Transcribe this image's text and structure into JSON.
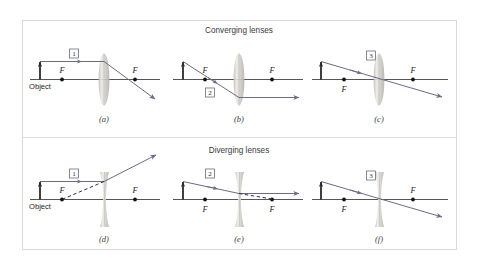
{
  "figure": {
    "background": "#ffffff",
    "frame_color": "#d8d8d8",
    "axis_color": "#555555",
    "ray_color": "#6b6b86",
    "lens_color": "#c9c7c2",
    "sections": [
      {
        "id": "converging",
        "title": "Converging lenses",
        "lens_type": "biconvex",
        "panels": [
          {
            "key": "a",
            "caption": "(a)",
            "ray_number": "1",
            "focal_labels": [
              "F",
              "F"
            ],
            "object_label": "Object",
            "ray_description": "Parallel ray refracts through far focal point"
          },
          {
            "key": "b",
            "caption": "(b)",
            "ray_number": "2",
            "focal_labels": [
              "F",
              "F"
            ],
            "object_label": "",
            "ray_description": "Ray through near focal point exits parallel to axis"
          },
          {
            "key": "c",
            "caption": "(c)",
            "ray_number": "3",
            "focal_labels": [
              "F",
              "F"
            ],
            "object_label": "",
            "ray_description": "Ray through lens center passes undeviated"
          }
        ]
      },
      {
        "id": "diverging",
        "title": "Diverging lenses",
        "lens_type": "biconcave",
        "panels": [
          {
            "key": "d",
            "caption": "(d)",
            "ray_number": "1",
            "focal_labels": [
              "F",
              "F"
            ],
            "object_label": "Object",
            "ray_description": "Parallel ray diverges; back-extension passes through near focal point"
          },
          {
            "key": "e",
            "caption": "(e)",
            "ray_number": "2",
            "focal_labels": [
              "F",
              "F"
            ],
            "object_label": "",
            "ray_description": "Ray aimed at far focal point exits parallel to axis"
          },
          {
            "key": "f",
            "caption": "(f)",
            "ray_number": "3",
            "focal_labels": [
              "F",
              "F"
            ],
            "object_label": "",
            "ray_description": "Ray through lens center passes undeviated"
          }
        ]
      }
    ]
  }
}
